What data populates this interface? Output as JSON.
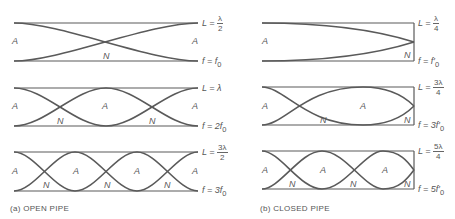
{
  "open_pipe": {
    "caption": "(a)  OPEN PIPE",
    "rows": [
      {
        "L_label": "L = ",
        "L_num": "λ",
        "L_den": "2",
        "f_label": "f = f",
        "f_sub": "0",
        "nodes": [
          "N"
        ],
        "antinodes": [
          "A",
          "A"
        ]
      },
      {
        "L_label": "L = λ",
        "f_label": "f = 2f",
        "f_sub": "0",
        "nodes": [
          "N",
          "N"
        ],
        "antinodes": [
          "A",
          "A",
          "A"
        ]
      },
      {
        "L_label": "L = ",
        "L_num": "3λ",
        "L_den": "2",
        "f_label": "f = 3f",
        "f_sub": "0",
        "nodes": [
          "N",
          "N",
          "N"
        ],
        "antinodes": [
          "A",
          "A",
          "A",
          "A"
        ]
      }
    ]
  },
  "closed_pipe": {
    "caption": "(b)  CLOSED PIPE",
    "rows": [
      {
        "L_label": "L = ",
        "L_num": "λ",
        "L_den": "4",
        "f_label": "f = f′",
        "f_sub": "0",
        "nodes": [
          "N"
        ],
        "antinodes": [
          "A"
        ]
      },
      {
        "L_label": "L = ",
        "L_num": "3λ",
        "L_den": "4",
        "f_label": "f = 3f′",
        "f_sub": "0",
        "nodes": [
          "N",
          "N"
        ],
        "antinodes": [
          "A",
          "A"
        ]
      },
      {
        "L_label": "L = ",
        "L_num": "5λ",
        "L_den": "4",
        "f_label": "f = 5f′",
        "f_sub": "0",
        "nodes": [
          "N",
          "N",
          "N"
        ],
        "antinodes": [
          "A",
          "A",
          "A"
        ]
      }
    ]
  },
  "colors": {
    "wave": "#5a5a5a",
    "pipe": "#555555"
  }
}
